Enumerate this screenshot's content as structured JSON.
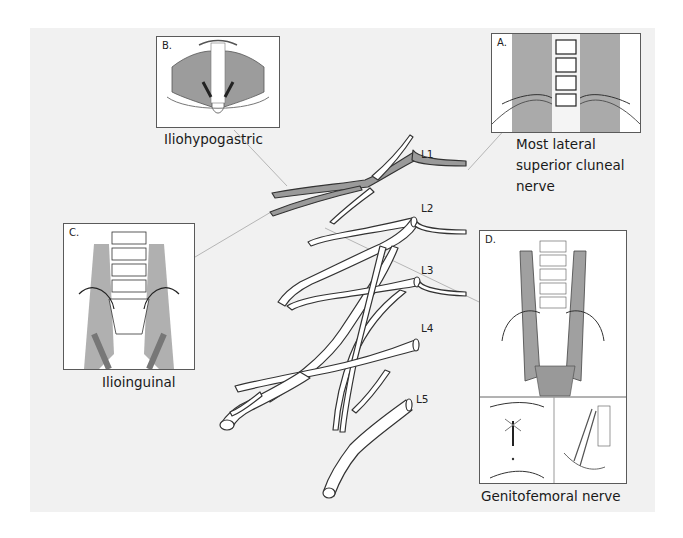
{
  "figure": {
    "insets": [
      {
        "id": "A",
        "letter": "A.",
        "caption_lines": [
          "Most lateral",
          "superior cluneal",
          "nerve"
        ],
        "region": "posterior lumbar / sacral region, dorsal view"
      },
      {
        "id": "B",
        "letter": "B.",
        "caption_lines": [
          "Iliohypogastric"
        ],
        "region": "abdominal wall muscles, anterior view"
      },
      {
        "id": "C",
        "letter": "C.",
        "caption_lines": [
          "Ilioinguinal"
        ],
        "region": "lumbar spine and pelvis, anterior view"
      },
      {
        "id": "D",
        "letter": "D.",
        "caption_lines": [
          "Genitofemoral nerve"
        ],
        "region": "pelvis with psoas, plus genital and femoral detail panels"
      }
    ],
    "plexus_levels": [
      "L1",
      "L2",
      "L3",
      "L4",
      "L5"
    ],
    "colors": {
      "background": "#f1f1f1",
      "nerve_fill": "#ffffff",
      "nerve_outline": "#3a3a3a",
      "highlight_nerve": "#9a9a9a",
      "leader_line": "#b8b8b8",
      "muscle": "#a6a6a6",
      "bone": "#ffffff"
    }
  }
}
